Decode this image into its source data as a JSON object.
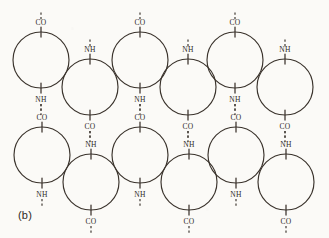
{
  "figure": {
    "caption": "(b)",
    "background_color": "#fbfaf7",
    "stroke_color": "#3a332c",
    "text_color": "#2e2a26",
    "circle_radius": 28,
    "label_font_size": 7.5,
    "rows": [
      {
        "name": "row-1",
        "circles": [
          {
            "id": "r1c1",
            "cx": 41,
            "cy": 60,
            "phase": "up",
            "top_label": "CO",
            "bottom_label": "NH",
            "top_dash": true,
            "bottom_dash": true
          },
          {
            "id": "r1c2",
            "cx": 90,
            "cy": 87,
            "phase": "down",
            "top_label": "NH",
            "bottom_label": "CO",
            "top_dash": true,
            "bottom_dash": true
          },
          {
            "id": "r1c3",
            "cx": 140,
            "cy": 60,
            "phase": "up",
            "top_label": "CO",
            "bottom_label": "NH",
            "top_dash": true,
            "bottom_dash": true
          },
          {
            "id": "r1c4",
            "cx": 188,
            "cy": 87,
            "phase": "down",
            "top_label": "NH",
            "bottom_label": "CO",
            "top_dash": true,
            "bottom_dash": true
          },
          {
            "id": "r1c5",
            "cx": 235,
            "cy": 60,
            "phase": "up",
            "top_label": "CO",
            "bottom_label": "NH",
            "top_dash": true,
            "bottom_dash": true
          },
          {
            "id": "r1c6",
            "cx": 285,
            "cy": 87,
            "phase": "down",
            "top_label": "NH",
            "bottom_label": "CO",
            "top_dash": true,
            "bottom_dash": true
          }
        ]
      },
      {
        "name": "row-2",
        "circles": [
          {
            "id": "r2c1",
            "cx": 42,
            "cy": 155,
            "phase": "up",
            "top_label": "CO",
            "bottom_label": "NH",
            "top_dash": false,
            "bottom_dash": true
          },
          {
            "id": "r2c2",
            "cx": 91,
            "cy": 182,
            "phase": "down",
            "top_label": "NH",
            "bottom_label": "CO",
            "top_dash": false,
            "bottom_dash": true
          },
          {
            "id": "r2c3",
            "cx": 140,
            "cy": 155,
            "phase": "up",
            "top_label": "CO",
            "bottom_label": "NH",
            "top_dash": false,
            "bottom_dash": true
          },
          {
            "id": "r2c4",
            "cx": 189,
            "cy": 182,
            "phase": "down",
            "top_label": "NH",
            "bottom_label": "CO",
            "top_dash": false,
            "bottom_dash": true
          },
          {
            "id": "r2c5",
            "cx": 236,
            "cy": 155,
            "phase": "up",
            "top_label": "CO",
            "bottom_label": "NH",
            "top_dash": false,
            "bottom_dash": true
          },
          {
            "id": "r2c6",
            "cx": 286,
            "cy": 182,
            "phase": "down",
            "top_label": "NH",
            "bottom_label": "CO",
            "top_dash": false,
            "bottom_dash": true
          }
        ]
      }
    ],
    "interchain_hbonds": [
      {
        "id": "hb1",
        "x": 41,
        "from_label": "NH",
        "to_label": "CO"
      },
      {
        "id": "hb2",
        "x": 90,
        "from_label": "CO",
        "to_label": "NH"
      },
      {
        "id": "hb3",
        "x": 140,
        "from_label": "NH",
        "to_label": "CO"
      },
      {
        "id": "hb4",
        "x": 188,
        "from_label": "CO",
        "to_label": "NH"
      },
      {
        "id": "hb5",
        "x": 235,
        "from_label": "NH",
        "to_label": "CO"
      },
      {
        "id": "hb6",
        "x": 285,
        "from_label": "CO",
        "to_label": "NH"
      }
    ]
  }
}
